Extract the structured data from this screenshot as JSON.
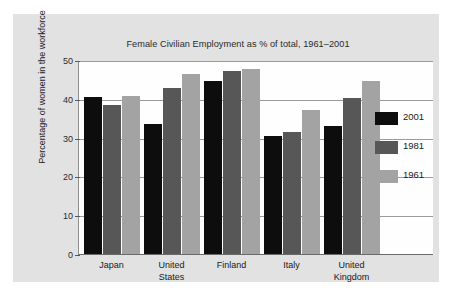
{
  "figure": {
    "panel_bg": "#e2e2e2",
    "plot_bg": "#fefefe",
    "axis_color": "#6a6a6a",
    "grid_color": "#9b9b9b"
  },
  "chart_data": {
    "type": "bar",
    "title": "Female Civilian Employment as % of total, 1961–2001",
    "xlabel": "",
    "ylabel": "Percentage of women in the workforce",
    "categories": [
      "Japan",
      "United States",
      "Finland",
      "Italy",
      "United Kingdom"
    ],
    "category_lines": [
      [
        "Japan"
      ],
      [
        "United",
        "States"
      ],
      [
        "Finland"
      ],
      [
        "Italy"
      ],
      [
        "United",
        "Kingdom"
      ]
    ],
    "series": [
      {
        "name": "2001",
        "color": "#0d0d0d",
        "values": [
          40.5,
          33.4,
          44.5,
          30.5,
          33.0
        ]
      },
      {
        "name": "1981",
        "color": "#575757",
        "values": [
          38.4,
          42.7,
          47.2,
          31.5,
          40.3
        ]
      },
      {
        "name": "1961",
        "color": "#a3a3a3",
        "values": [
          40.8,
          46.3,
          47.8,
          37.2,
          44.7
        ]
      }
    ],
    "ylim": [
      0,
      50
    ],
    "yticks": [
      0,
      10,
      20,
      30,
      40,
      50
    ],
    "ytick_labels": [
      "0",
      "10",
      "20",
      "30",
      "40",
      "50"
    ],
    "grid": true,
    "grid_axis": "y",
    "legend_position": "right-inside",
    "legend_entries": [
      {
        "label": "2001",
        "color": "#0d0d0d"
      },
      {
        "label": "1981",
        "color": "#575757"
      },
      {
        "label": "1961",
        "color": "#a3a3a3"
      }
    ]
  }
}
